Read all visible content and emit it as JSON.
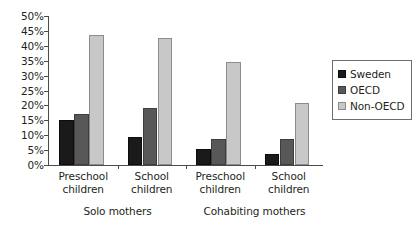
{
  "chart_data": {
    "type": "bar",
    "title": "",
    "xlabel": "",
    "ylabel": "",
    "ylim": [
      0,
      50
    ],
    "grid": false,
    "legend_position": "right",
    "y_ticks": [
      "0%",
      "5%",
      "10%",
      "15%",
      "20%",
      "25%",
      "30%",
      "35%",
      "40%",
      "45%",
      "50%"
    ],
    "y_tick_values": [
      0,
      5,
      10,
      15,
      20,
      25,
      30,
      35,
      40,
      45,
      50
    ],
    "categories": [
      "Preschool children",
      "School children",
      "Preschool children",
      "School children"
    ],
    "category_lines": [
      [
        "Preschool",
        "children"
      ],
      [
        "School",
        "children"
      ],
      [
        "Preschool",
        "children"
      ],
      [
        "School",
        "children"
      ]
    ],
    "group_labels": [
      "Solo mothers",
      "Cohabiting mothers"
    ],
    "series": [
      {
        "name": "Sweden",
        "color": "#1a1a1a",
        "values": [
          15.0,
          9.3,
          5.5,
          3.8
        ]
      },
      {
        "name": "OECD",
        "color": "#585858",
        "values": [
          17.0,
          19.3,
          8.7,
          8.8
        ]
      },
      {
        "name": "Non-OECD",
        "color": "#c8c8c8",
        "values": [
          43.5,
          42.5,
          34.5,
          20.8
        ]
      }
    ]
  },
  "legend": {
    "items": [
      {
        "label": "Sweden"
      },
      {
        "label": "OECD"
      },
      {
        "label": "Non-OECD"
      }
    ]
  }
}
